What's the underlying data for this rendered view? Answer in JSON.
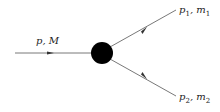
{
  "diagram": {
    "type": "two-body decay",
    "incoming": {
      "momentum": "p",
      "mass": "M",
      "label": "p, M"
    },
    "outgoing": [
      {
        "momentum": "p",
        "mass": "m",
        "index": "1"
      },
      {
        "momentum": "p",
        "mass": "m",
        "index": "2"
      }
    ],
    "vertex": {
      "shape": "filled-circle",
      "color": "#000000"
    },
    "line_color": "#555555"
  }
}
